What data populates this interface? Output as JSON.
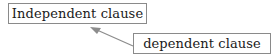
{
  "diagram": {
    "independent_label": "Independent clause",
    "dependent_label": "dependent clause",
    "arrow": {
      "from": "dependent clause",
      "to": "Independent clause",
      "color": "#8c8c8c"
    }
  }
}
